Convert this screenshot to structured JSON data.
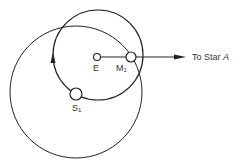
{
  "diagram": {
    "type": "orbital-geometry",
    "labels": {
      "earth": "E",
      "moon": "M",
      "moon_sub": "1",
      "sun": "S",
      "sun_sub": "1",
      "star_prefix": "To Star ",
      "star_name": "A"
    },
    "elements": {
      "moon_orbit": {
        "cx": 98,
        "cy": 55,
        "r": 45
      },
      "sun_orbit": {
        "cx": 76,
        "cy": 92,
        "r": 66
      },
      "earth": {
        "cx": 97,
        "cy": 57,
        "r": 4
      },
      "moon": {
        "cx": 131,
        "cy": 57,
        "r": 5
      },
      "sun": {
        "cx": 76,
        "cy": 94,
        "r": 6
      },
      "direction_arrow": {
        "x1": 101,
        "y1": 57,
        "x2": 186,
        "y2": 57
      }
    },
    "colors": {
      "stroke": "#222222",
      "background": "#ffffff"
    }
  }
}
